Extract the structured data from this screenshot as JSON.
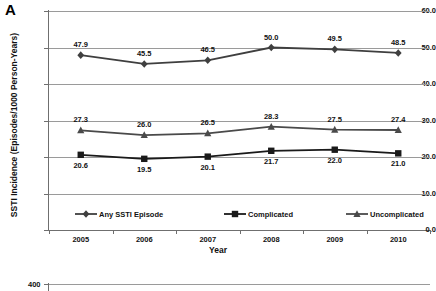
{
  "figure": {
    "panel_a_letter": "A",
    "panel_b_letter": "B"
  },
  "chart_data": {
    "type": "line",
    "title": "",
    "xlabel": "Year",
    "ylabel": "SSTI Incidence (Episodes/1000 Person-Years)",
    "categories": [
      "2005",
      "2006",
      "2007",
      "2008",
      "2009",
      "2010"
    ],
    "x": [
      2005,
      2006,
      2007,
      2008,
      2009,
      2010
    ],
    "ylim": [
      0.0,
      60.0
    ],
    "yticks": [
      "0.0",
      "10.0",
      "20.0",
      "30.0",
      "40.0",
      "50.0",
      "60.0"
    ],
    "ytick_values": [
      0.0,
      10.0,
      20.0,
      30.0,
      40.0,
      50.0,
      60.0
    ],
    "grid": true,
    "legend_position": "inside-bottom",
    "series": [
      {
        "name": "Any SSTI Episode",
        "marker": "diamond",
        "color": "#3f3f3f",
        "values": [
          47.9,
          45.5,
          46.5,
          50.0,
          49.5,
          48.5
        ],
        "labels": [
          "47.9",
          "45.5",
          "46.5",
          "50.0",
          "49.5",
          "48.5"
        ],
        "label_position": "above"
      },
      {
        "name": "Complicated",
        "marker": "square",
        "color": "#1a1a1a",
        "values": [
          20.6,
          19.5,
          20.1,
          21.7,
          22.0,
          21.0
        ],
        "labels": [
          "20.6",
          "19.5",
          "20.1",
          "21.7",
          "22.0",
          "21.0"
        ],
        "label_position": "below"
      },
      {
        "name": "Uncomplicated",
        "marker": "triangle",
        "color": "#4a4a4a",
        "values": [
          27.3,
          26.0,
          26.5,
          28.3,
          27.5,
          27.4
        ],
        "labels": [
          "27.3",
          "26.0",
          "26.5",
          "28.3",
          "27.5",
          "27.4"
        ],
        "label_position": "above"
      }
    ]
  },
  "panel_b": {
    "ytick_top": "400"
  }
}
